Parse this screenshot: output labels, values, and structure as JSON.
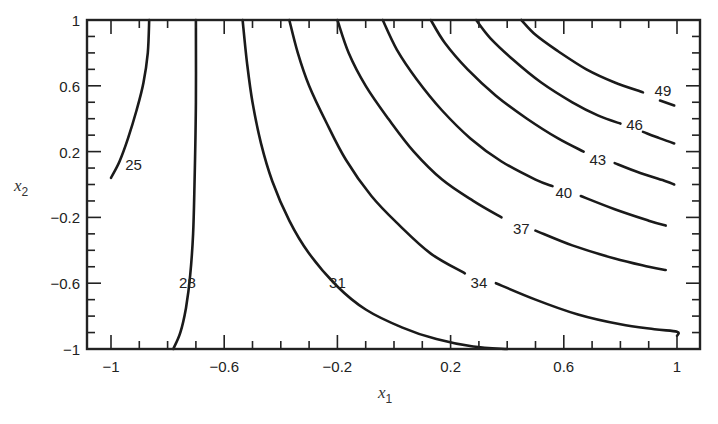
{
  "chart_data": {
    "type": "contour",
    "title": "",
    "xlabel": "x1",
    "ylabel": "x2",
    "xlabel_main": "x",
    "xlabel_sub": "1",
    "ylabel_main": "x",
    "ylabel_sub": "2",
    "xlim": [
      -1,
      1
    ],
    "ylim": [
      -1,
      1
    ],
    "grid": false,
    "legend": "none",
    "x_major_ticks": [
      -1,
      -0.6,
      -0.2,
      0.2,
      0.6,
      1
    ],
    "x_tick_labels": [
      "−1",
      "−0.6",
      "−0.2",
      "0.2",
      "0.6",
      "1"
    ],
    "y_major_ticks": [
      1,
      0.6,
      0.2,
      -0.2,
      -0.6,
      -1
    ],
    "y_tick_labels": [
      "1",
      "0.6",
      "0.2",
      "−0.2",
      "−0.6",
      "−1"
    ],
    "minor_tick_step": 0.1,
    "contour_levels": [
      25,
      28,
      31,
      34,
      37,
      40,
      43,
      46,
      49
    ],
    "contours": [
      {
        "level": 25,
        "label": "25",
        "label_pos": [
          -0.92,
          0.12
        ],
        "points": [
          [
            -1.0,
            0.04
          ],
          [
            -0.97,
            0.14
          ],
          [
            -0.94,
            0.28
          ],
          [
            -0.91,
            0.45
          ],
          [
            -0.885,
            0.62
          ],
          [
            -0.87,
            0.8
          ],
          [
            -0.865,
            1.0
          ]
        ]
      },
      {
        "level": 28,
        "label": "28",
        "label_pos": [
          -0.73,
          -0.6
        ],
        "points": [
          [
            -0.78,
            -1.0
          ],
          [
            -0.755,
            -0.9
          ],
          [
            -0.735,
            -0.75
          ],
          [
            -0.72,
            -0.55
          ],
          [
            -0.71,
            -0.3
          ],
          [
            -0.705,
            0.0
          ],
          [
            -0.7,
            0.5
          ],
          [
            -0.7,
            1.0
          ]
        ]
      },
      {
        "level": 31,
        "label": "31",
        "label_pos": [
          -0.2,
          -0.6
        ],
        "points": [
          [
            -0.535,
            1.0
          ],
          [
            -0.52,
            0.75
          ],
          [
            -0.5,
            0.5
          ],
          [
            -0.47,
            0.25
          ],
          [
            -0.43,
            0.02
          ],
          [
            -0.37,
            -0.22
          ],
          [
            -0.3,
            -0.42
          ],
          [
            -0.2,
            -0.62
          ],
          [
            -0.1,
            -0.76
          ],
          [
            0.03,
            -0.87
          ],
          [
            0.15,
            -0.94
          ],
          [
            0.28,
            -0.985
          ],
          [
            0.4,
            -1.0
          ]
        ]
      },
      {
        "level": 34,
        "label": "34",
        "label_pos": [
          0.3,
          -0.6
        ],
        "points": [
          [
            -0.37,
            1.0
          ],
          [
            -0.34,
            0.8
          ],
          [
            -0.3,
            0.6
          ],
          [
            -0.24,
            0.38
          ],
          [
            -0.17,
            0.15
          ],
          [
            -0.08,
            -0.07
          ],
          [
            0.02,
            -0.25
          ],
          [
            0.13,
            -0.42
          ],
          [
            0.25,
            -0.54
          ]
        ],
        "points2": [
          [
            0.36,
            -0.6
          ],
          [
            0.5,
            -0.7
          ],
          [
            0.65,
            -0.79
          ],
          [
            0.8,
            -0.85
          ],
          [
            0.92,
            -0.88
          ],
          [
            1.0,
            -0.895
          ],
          [
            1.0,
            -0.92
          ]
        ]
      },
      {
        "level": 37,
        "label": "37",
        "label_pos": [
          0.45,
          -0.27
        ],
        "points": [
          [
            -0.2,
            1.0
          ],
          [
            -0.16,
            0.8
          ],
          [
            -0.1,
            0.6
          ],
          [
            -0.02,
            0.4
          ],
          [
            0.07,
            0.2
          ],
          [
            0.17,
            0.03
          ],
          [
            0.28,
            -0.1
          ],
          [
            0.38,
            -0.2
          ]
        ],
        "points2": [
          [
            0.5,
            -0.28
          ],
          [
            0.63,
            -0.37
          ],
          [
            0.78,
            -0.45
          ],
          [
            0.9,
            -0.5
          ],
          [
            0.96,
            -0.52
          ]
        ]
      },
      {
        "level": 40,
        "label": "40",
        "label_pos": [
          0.6,
          -0.05
        ],
        "points": [
          [
            -0.04,
            1.0
          ],
          [
            0.01,
            0.82
          ],
          [
            0.08,
            0.64
          ],
          [
            0.17,
            0.45
          ],
          [
            0.27,
            0.28
          ],
          [
            0.38,
            0.14
          ],
          [
            0.5,
            0.03
          ],
          [
            0.56,
            -0.01
          ]
        ],
        "points2": [
          [
            0.66,
            -0.07
          ],
          [
            0.78,
            -0.15
          ],
          [
            0.9,
            -0.22
          ],
          [
            0.96,
            -0.25
          ]
        ]
      },
      {
        "level": 43,
        "label": "43",
        "label_pos": [
          0.72,
          0.15
        ],
        "points": [
          [
            0.13,
            1.0
          ],
          [
            0.18,
            0.86
          ],
          [
            0.26,
            0.7
          ],
          [
            0.36,
            0.54
          ],
          [
            0.47,
            0.4
          ],
          [
            0.58,
            0.28
          ],
          [
            0.67,
            0.2
          ]
        ],
        "points2": [
          [
            0.78,
            0.13
          ],
          [
            0.87,
            0.07
          ],
          [
            0.96,
            0.02
          ],
          [
            0.99,
            0.0
          ]
        ]
      },
      {
        "level": 46,
        "label": "46",
        "label_pos": [
          0.85,
          0.36
        ],
        "points": [
          [
            0.29,
            1.0
          ],
          [
            0.34,
            0.89
          ],
          [
            0.42,
            0.76
          ],
          [
            0.52,
            0.62
          ],
          [
            0.63,
            0.5
          ],
          [
            0.72,
            0.42
          ],
          [
            0.8,
            0.37
          ]
        ],
        "points2": [
          [
            0.88,
            0.32
          ],
          [
            0.94,
            0.28
          ],
          [
            0.99,
            0.25
          ]
        ]
      },
      {
        "level": 49,
        "label": "49",
        "label_pos": [
          0.95,
          0.57
        ],
        "points": [
          [
            0.45,
            1.0
          ],
          [
            0.5,
            0.91
          ],
          [
            0.58,
            0.81
          ],
          [
            0.68,
            0.7
          ],
          [
            0.78,
            0.62
          ],
          [
            0.88,
            0.56
          ]
        ],
        "points2": [
          [
            0.94,
            0.51
          ],
          [
            0.99,
            0.48
          ]
        ]
      }
    ]
  },
  "colors": {
    "background": "#ffffff",
    "ink": "#1a1a1a",
    "frame": "#222222"
  }
}
